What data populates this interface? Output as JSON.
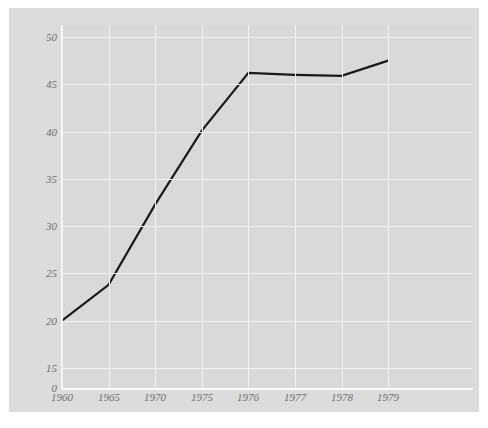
{
  "chart_data": {
    "type": "line",
    "title": "",
    "subtitle": "",
    "xlabel": "",
    "ylabel": "",
    "categories": [
      "1960",
      "1965",
      "1970",
      "1975",
      "1976",
      "1977",
      "1978",
      "1979"
    ],
    "values": [
      20.0,
      23.8,
      32.3,
      40.1,
      46.2,
      46.0,
      45.9,
      47.5
    ],
    "series": [
      {
        "name": "",
        "values": [
          20.0,
          23.8,
          32.3,
          40.1,
          46.2,
          46.0,
          45.9,
          47.5
        ]
      }
    ],
    "y_ticks": [
      "0",
      "15",
      "20",
      "25",
      "30",
      "35",
      "40",
      "45",
      "50"
    ],
    "y_tick_values": [
      0,
      15,
      20,
      25,
      30,
      35,
      40,
      45,
      50
    ],
    "ylim": [
      15,
      50
    ],
    "y_axis_break": true,
    "y_zero_label": "0",
    "x_ticks": [
      "1960",
      "1965",
      "1970",
      "1975",
      "1976",
      "1977",
      "1978",
      "1979"
    ],
    "grid": true,
    "legend": "none",
    "legend_entries": [],
    "annotations": [],
    "colors": {
      "line": "#1a1a1a",
      "plot_background": "#d9d9d9",
      "panel_background": "#dcdcdc",
      "figure_background": "#ffffff",
      "gridline": "#f2f2f2",
      "tick_label": "#6f6f6f"
    }
  }
}
